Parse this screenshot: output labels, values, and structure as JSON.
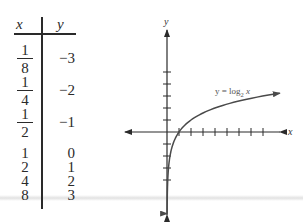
{
  "table": {
    "headers": {
      "x": "x",
      "y": "y"
    },
    "rows": [
      {
        "x": {
          "type": "fraction",
          "num": "1",
          "den": "8"
        },
        "y": "−3"
      },
      {
        "x": {
          "type": "fraction",
          "num": "1",
          "den": "4"
        },
        "y": "−2"
      },
      {
        "x": {
          "type": "fraction",
          "num": "1",
          "den": "2"
        },
        "y": "−1"
      },
      {
        "x": {
          "type": "int",
          "text": "1"
        },
        "y": "0"
      },
      {
        "x": {
          "type": "int",
          "text": "2"
        },
        "y": "1"
      },
      {
        "x": {
          "type": "int",
          "text": "4"
        },
        "y": "2"
      },
      {
        "x": {
          "type": "int",
          "text": "8"
        },
        "y": "3"
      }
    ]
  },
  "graph": {
    "x_axis_label": "x",
    "y_axis_label": "y",
    "curve_label": {
      "prefix": "y = log",
      "subscript": "2",
      "suffix": " x"
    },
    "function": "log2",
    "x_tick_range": [
      1,
      8
    ],
    "y_tick_range": [
      -4,
      5
    ],
    "colors": {
      "axis": "#2a2a2a",
      "curve": "#4a4a4a",
      "label": "#555555"
    }
  },
  "chart_data": {
    "type": "line",
    "title": "",
    "xlabel": "x",
    "ylabel": "y",
    "series": [
      {
        "name": "y = log2 x",
        "x": [
          0.125,
          0.25,
          0.5,
          1,
          2,
          4,
          8
        ],
        "y": [
          -3,
          -2,
          -1,
          0,
          1,
          2,
          3
        ]
      }
    ],
    "x_ticks": [
      1,
      2,
      3,
      4,
      5,
      6,
      7,
      8
    ],
    "y_ticks": [
      -4,
      -3,
      -2,
      -1,
      1,
      2,
      3,
      4,
      5
    ],
    "xlim": [
      -3.5,
      9.5
    ],
    "ylim": [
      -7,
      9
    ],
    "grid": false,
    "legend": "annotation near curve, upper-right"
  }
}
